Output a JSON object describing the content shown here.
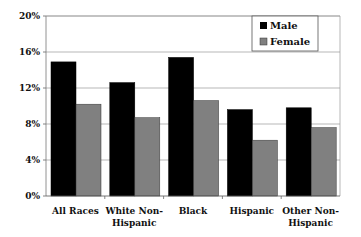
{
  "chart_data": {
    "type": "bar",
    "title": "",
    "xlabel": "",
    "ylabel": "",
    "categories": [
      [
        "All Races"
      ],
      [
        "White Non-",
        "Hispanic"
      ],
      [
        "Black"
      ],
      [
        "Hispanic"
      ],
      [
        "Other Non-",
        "Hispanic"
      ]
    ],
    "series": [
      {
        "name": "Male",
        "color": "#000000",
        "values": [
          14.9,
          12.6,
          15.4,
          9.6,
          9.8
        ]
      },
      {
        "name": "Female",
        "color": "#808080",
        "values": [
          10.2,
          8.7,
          10.6,
          6.2,
          7.6
        ]
      }
    ],
    "ylim": [
      0,
      20
    ],
    "yticks": [
      "0%",
      "4%",
      "8%",
      "12%",
      "16%",
      "20%"
    ],
    "ytick_values": [
      0,
      4,
      8,
      12,
      16,
      20
    ],
    "grid": true,
    "legend_position": "top-right"
  }
}
